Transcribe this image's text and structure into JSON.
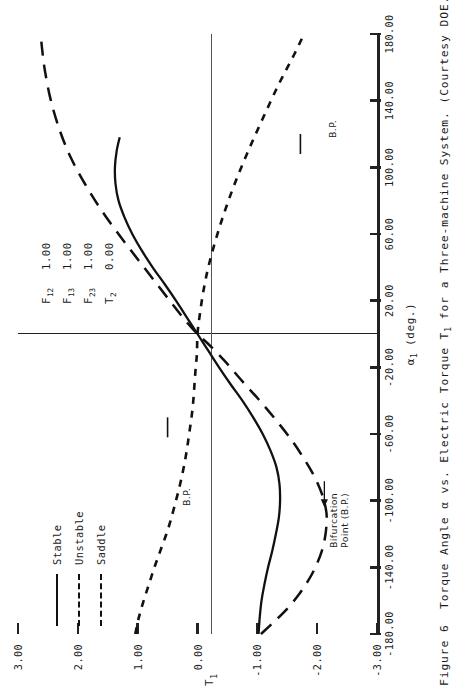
{
  "figure": {
    "caption_number": "Figure 6",
    "caption_text_1": "Torque Angle ",
    "caption_alpha": "α",
    "caption_text_2": " vs. Electric Torque T",
    "caption_sub": "1",
    "caption_text_3": " for a Three-machine System.  (Courtesy DOE.)"
  },
  "axes": {
    "x_title_main": "α",
    "x_title_sub": "1",
    "x_title_units": " (deg.)",
    "y_title_main": "T",
    "y_title_sub": "1",
    "x_ticks": [
      "-180.00",
      "-140.00",
      "-100.00",
      "-60.00",
      "-20.00",
      "20.00",
      "60.00",
      "100.00",
      "140.00",
      "180.00"
    ],
    "y_ticks": [
      "3.00",
      "2.00",
      "1.00",
      "0.00",
      "-1.00",
      "-2.00",
      "-3.00"
    ]
  },
  "legend": {
    "items": [
      {
        "label": "Stable",
        "style": "solid"
      },
      {
        "label": "Unstable",
        "style": "dotted"
      },
      {
        "label": "Saddle",
        "style": "dashed"
      }
    ]
  },
  "parameters": [
    {
      "name": "F",
      "sub": "12",
      "value": "1.00"
    },
    {
      "name": "F",
      "sub": "13",
      "value": "1.00"
    },
    {
      "name": "F",
      "sub": "23",
      "value": "1.00"
    },
    {
      "name": "T",
      "sub": "2",
      "value": "0.00"
    }
  ],
  "annotations": {
    "bp_short": "B.P.",
    "bp_long_line1": "Bifurcation",
    "bp_long_line2": "Point (B.P.)"
  },
  "colors": {
    "ink": "#1b1b1b",
    "axis": "#222222",
    "zero_line": "#555555",
    "paper": "#ffffff"
  },
  "chart_data": {
    "type": "line",
    "title": "Torque Angle α vs. Electric Torque T1 for a Three-machine System",
    "xlabel": "α1 (deg.)",
    "ylabel": "T1",
    "xlim": [
      -180,
      180
    ],
    "ylim": [
      -3,
      3
    ],
    "xticks": [
      -180,
      -140,
      -100,
      -60,
      -20,
      20,
      60,
      100,
      140,
      180
    ],
    "yticks": [
      3,
      2,
      1,
      0,
      -1,
      -2,
      -3
    ],
    "grid": false,
    "legend_position": "upper-left",
    "annotations": [
      {
        "text": "B.P.",
        "x": -60,
        "y": 0.42
      },
      {
        "text": "B.P.",
        "x": 112,
        "y": -1.85
      },
      {
        "text": "Bifurcation Point (B.P.)",
        "x": -104,
        "y": -2.1
      }
    ],
    "parameters": {
      "F12": 1.0,
      "F13": 1.0,
      "F23": 1.0,
      "T2": 0.0
    },
    "series": [
      {
        "name": "Stable",
        "style": "solid",
        "x": [
          -180,
          -170,
          -160,
          -150,
          -140,
          -130,
          -120,
          -110,
          -100,
          -90,
          -80,
          -70,
          -60,
          -50,
          -40,
          -30,
          -20,
          -10,
          0,
          10,
          20,
          30,
          40,
          50,
          60,
          70,
          80,
          90,
          100,
          110,
          118
        ],
        "y": [
          -1.02,
          -1.04,
          -1.07,
          -1.12,
          -1.18,
          -1.25,
          -1.31,
          -1.36,
          -1.38,
          -1.37,
          -1.32,
          -1.22,
          -1.09,
          -0.93,
          -0.75,
          -0.55,
          -0.36,
          -0.18,
          0.0,
          0.18,
          0.36,
          0.55,
          0.75,
          0.93,
          1.09,
          1.22,
          1.32,
          1.37,
          1.38,
          1.35,
          1.3
        ]
      },
      {
        "name": "Unstable",
        "style": "dotted",
        "x": [
          -180,
          -170,
          -160,
          -150,
          -140,
          -130,
          -120,
          -112,
          -100,
          -90,
          -80,
          -70,
          -60,
          -50,
          -40,
          -30,
          -20,
          -12,
          0,
          12,
          26,
          40,
          56,
          72,
          90,
          110,
          130,
          150,
          168,
          180
        ],
        "y": [
          1.04,
          0.98,
          0.9,
          0.81,
          0.72,
          0.62,
          0.52,
          0.45,
          0.36,
          0.29,
          0.23,
          0.18,
          0.14,
          0.1,
          0.07,
          0.05,
          0.03,
          0.01,
          0.0,
          -0.04,
          -0.1,
          -0.18,
          -0.3,
          -0.44,
          -0.62,
          -0.85,
          -1.1,
          -1.36,
          -1.62,
          -1.78
        ]
      },
      {
        "name": "Saddle",
        "style": "dashed",
        "x": [
          -180,
          -172,
          -164,
          -156,
          -148,
          -140,
          -130,
          -120,
          -110,
          -104,
          -96,
          -86,
          -76,
          -64,
          -52,
          -40,
          -28,
          -16,
          -6,
          0,
          8,
          18,
          30,
          44,
          58,
          74,
          90,
          106,
          122,
          140,
          158,
          172,
          180
        ],
        "y": [
          -1.06,
          -1.3,
          -1.52,
          -1.7,
          -1.85,
          -1.97,
          -2.08,
          -2.14,
          -2.16,
          -2.14,
          -2.08,
          -1.96,
          -1.8,
          -1.58,
          -1.32,
          -1.04,
          -0.74,
          -0.45,
          -0.18,
          0.0,
          0.2,
          0.42,
          0.68,
          0.98,
          1.28,
          1.6,
          1.88,
          2.12,
          2.3,
          2.45,
          2.55,
          2.6,
          2.62
        ]
      }
    ]
  }
}
